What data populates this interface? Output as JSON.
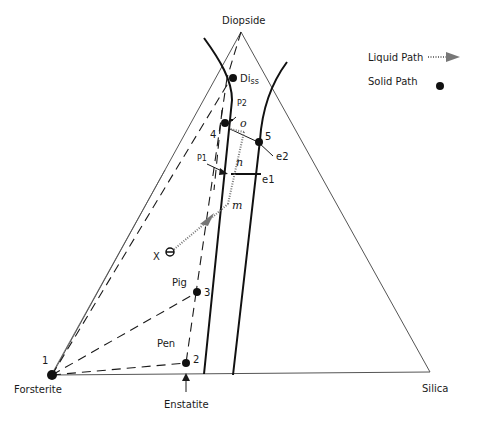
{
  "diagram": {
    "type": "ternary-phase-diagram",
    "vertices": {
      "top": "Diopside",
      "left": "Forsterite",
      "right": "Silica"
    },
    "bottom_marker": "Enstatite",
    "legend": {
      "liquid_path_label": "Liquid Path",
      "solid_path_label": "Solid Path"
    },
    "points": {
      "p1": "1",
      "p2": "2",
      "p3": "3",
      "p4": "4",
      "p5": "5",
      "diss": "Di",
      "diss_sub": "ss",
      "pig": "Pig",
      "pen": "Pen",
      "x": "X",
      "P1": "P1",
      "P2": "P2",
      "o": "o",
      "n": "n",
      "m": "m",
      "e1": "e1",
      "e2": "e2"
    },
    "colors": {
      "line": "#1a1a1a",
      "triangle": "#555555",
      "liquid_path": "#888888"
    }
  }
}
